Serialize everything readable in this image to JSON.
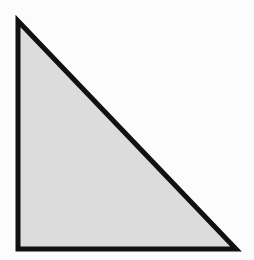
{
  "diagram": {
    "type": "right-triangle",
    "fill_color": "#dcdcdc",
    "stroke_color": "#111111",
    "stroke_width": 5,
    "background": "#fcfcfc",
    "vertices": [
      {
        "name": "top",
        "x": 18,
        "y": 21
      },
      {
        "name": "bottom-left",
        "x": 18,
        "y": 249
      },
      {
        "name": "bottom-right",
        "x": 236,
        "y": 249
      }
    ]
  }
}
